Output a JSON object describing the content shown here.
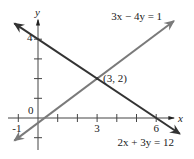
{
  "chart_data": {
    "type": "line",
    "title": "",
    "xlabel": "x",
    "ylabel": "y",
    "xlim": [
      -1.3,
      7.3
    ],
    "ylim": [
      -1.6,
      4.9
    ],
    "grid": false,
    "x_ticks": [
      -1,
      0,
      1,
      2,
      3,
      4,
      5,
      6
    ],
    "x_tick_labels": [
      {
        "value": -1,
        "label": "-1"
      },
      {
        "value": 0,
        "label": "0"
      },
      {
        "value": 3,
        "label": "3"
      },
      {
        "value": 6,
        "label": "6"
      }
    ],
    "y_ticks": [
      -1,
      1,
      2,
      3,
      4
    ],
    "y_tick_labels": [
      {
        "value": 4,
        "label": "4"
      }
    ],
    "series": [
      {
        "name": "2x + 3y = 12",
        "equation": "2x + 3y = 12",
        "color": "#333333",
        "x": [
          -1.2,
          7.2
        ],
        "y": [
          4.8,
          -0.8
        ],
        "label_anchor": [
          6.9,
          -1.4
        ]
      },
      {
        "name": "3x − 4y = 1",
        "equation": "3x − 4y = 1",
        "color": "#7a7a7a",
        "x": [
          -1.2,
          6.9
        ],
        "y": [
          -1.15,
          4.925
        ],
        "label_anchor": [
          6.3,
          4.95
        ]
      }
    ],
    "annotations": [
      {
        "text": "(3, 2)",
        "x": 3,
        "y": 2
      }
    ]
  }
}
